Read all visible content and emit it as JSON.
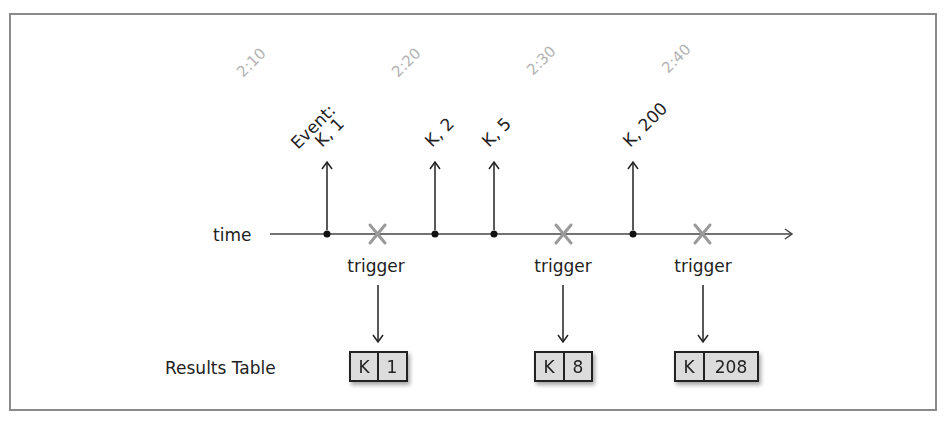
{
  "diagram": {
    "axis_label": "time",
    "time_ticks": [
      {
        "label": "2:10",
        "x": 250
      },
      {
        "label": "2:20",
        "x": 405
      },
      {
        "label": "2:30",
        "x": 545
      },
      {
        "label": "2:40",
        "x": 680
      }
    ],
    "events": [
      {
        "label": "K, 1",
        "prefix": "Event:",
        "x": 327
      },
      {
        "label": "K, 2",
        "x": 435
      },
      {
        "label": "K, 5",
        "x": 494
      },
      {
        "label": "K, 200",
        "x": 633
      }
    ],
    "triggers": [
      {
        "label": "trigger",
        "x": 377
      },
      {
        "label": "trigger",
        "x": 563
      },
      {
        "label": "trigger",
        "x": 702
      }
    ],
    "results_label": "Results Table",
    "results": [
      {
        "key": "K",
        "value": "1",
        "x": 378
      },
      {
        "key": "K",
        "value": "8",
        "x": 563
      },
      {
        "key": "K",
        "value": "208",
        "x": 712
      }
    ],
    "colors": {
      "line": "#222222",
      "trigger_mark": "#9a9a9a",
      "tick_text": "#b3b3b3",
      "cell_fill": "#dcdcdc",
      "frame": "#8a8a8a"
    }
  }
}
